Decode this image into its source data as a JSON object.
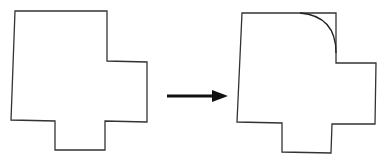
{
  "diagram": {
    "colors": {
      "stroke": "#333333",
      "arrow": "#111111",
      "background": "#ffffff"
    },
    "left_shape": {
      "label": "original-outline",
      "points": "15,11 107,11 107,61 147,62 147,122 105,121 105,150 55,150 55,121 11,120"
    },
    "arrow": {
      "x1": 167,
      "y1": 96,
      "x2": 226,
      "y2": 96
    },
    "right_shape": {
      "label": "rounded-outline",
      "path": "M242,13 L336,13 L336,63 L376,63 L375,124 L332,124 L331,153 L282,152 L282,123 L237,122 Z",
      "arc": "M300,13 Q336,16 336,53"
    }
  }
}
